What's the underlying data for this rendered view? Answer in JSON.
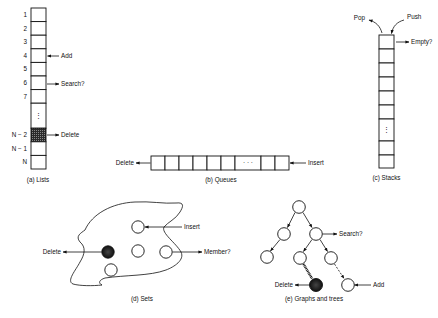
{
  "figure": {
    "panels": {
      "lists": {
        "caption": "(a) Lists",
        "indices": [
          "1",
          "2",
          "3",
          "4",
          "5",
          "6",
          "7",
          "N − 2",
          "N − 1",
          "N"
        ],
        "ellipsis": "⋮",
        "ops": {
          "add": "Add",
          "search": "Search?",
          "delete": "Delete"
        }
      },
      "queues": {
        "caption": "(b) Queues",
        "ellipsis": "· · ·",
        "ops": {
          "delete": "Delete",
          "insert": "Insert"
        }
      },
      "stacks": {
        "caption": "(c) Stacks",
        "ellipsis": "⋮",
        "ops": {
          "pop": "Pop",
          "push": "Push",
          "empty": "Empty?"
        }
      },
      "sets": {
        "caption": "(d) Sets",
        "ops": {
          "insert": "Insert",
          "delete": "Delete",
          "member": "Member?"
        }
      },
      "graphs_trees": {
        "caption": "(e) Graphs and trees",
        "ops": {
          "search": "Search?",
          "delete": "Delete",
          "add": "Add"
        }
      }
    },
    "colors": {
      "ink": "#111111",
      "background": "#ffffff",
      "highlight": "#222222"
    }
  }
}
